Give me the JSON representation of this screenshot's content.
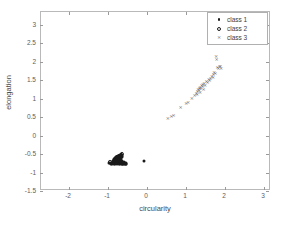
{
  "figure": {
    "background_color": "#ffffff",
    "frame_color": "#b9b9b9"
  },
  "legend": {
    "position": "upper-right",
    "entries": [
      {
        "label": "class 1",
        "marker": "filled-dot-icon",
        "color": "#1a1a1a"
      },
      {
        "label": "class 2",
        "marker": "open-circle-icon",
        "color": "#1a1a1a"
      },
      {
        "label": "class 3",
        "marker": "cross-x-icon",
        "color": "#6b6b6b"
      }
    ]
  },
  "chart_data": {
    "type": "scatter",
    "title": "",
    "xlabel": "circularity",
    "ylabel": "elongation",
    "xlim": [
      -2.72,
      3.18
    ],
    "ylim": [
      -1.5,
      3.35
    ],
    "xticks": [
      -2,
      -1,
      0,
      1,
      2,
      3
    ],
    "xticklabels": [
      "-2",
      "-1",
      "0",
      "1",
      "2",
      "3"
    ],
    "yticks": [
      -1.5,
      -1,
      -0.5,
      0,
      0.5,
      1,
      1.5,
      2,
      2.5,
      3
    ],
    "yticklabels": [
      "-1.5",
      "-1",
      "-0.5",
      "0",
      "0.5",
      "1",
      "1.5",
      "2",
      "2.5",
      "3"
    ],
    "grid": false,
    "series": [
      {
        "name": "class 1",
        "marker": "filled-dot",
        "color": "#1a1a1a",
        "points": [
          [
            -0.97,
            -0.75
          ],
          [
            -0.94,
            -0.74
          ],
          [
            -0.92,
            -0.76
          ],
          [
            -0.9,
            -0.73
          ],
          [
            -0.89,
            -0.77
          ],
          [
            -0.88,
            -0.7
          ],
          [
            -0.86,
            -0.75
          ],
          [
            -0.85,
            -0.72
          ],
          [
            -0.84,
            -0.78
          ],
          [
            -0.83,
            -0.69
          ],
          [
            -0.82,
            -0.74
          ],
          [
            -0.81,
            -0.77
          ],
          [
            -0.8,
            -0.71
          ],
          [
            -0.79,
            -0.75
          ],
          [
            -0.78,
            -0.68
          ],
          [
            -0.77,
            -0.73
          ],
          [
            -0.76,
            -0.78
          ],
          [
            -0.75,
            -0.7
          ],
          [
            -0.74,
            -0.75
          ],
          [
            -0.73,
            -0.72
          ],
          [
            -0.72,
            -0.77
          ],
          [
            -0.71,
            -0.69
          ],
          [
            -0.7,
            -0.74
          ],
          [
            -0.69,
            -0.78
          ],
          [
            -0.68,
            -0.71
          ],
          [
            -0.67,
            -0.75
          ],
          [
            -0.66,
            -0.73
          ],
          [
            -0.65,
            -0.77
          ],
          [
            -0.64,
            -0.7
          ],
          [
            -0.63,
            -0.76
          ],
          [
            -0.62,
            -0.73
          ],
          [
            -0.61,
            -0.78
          ],
          [
            -0.6,
            -0.72
          ],
          [
            -0.59,
            -0.76
          ],
          [
            -0.58,
            -0.74
          ],
          [
            -0.57,
            -0.78
          ],
          [
            -0.56,
            -0.75
          ],
          [
            -0.55,
            -0.77
          ],
          [
            -0.54,
            -0.74
          ],
          [
            -0.53,
            -0.76
          ],
          [
            -0.86,
            -0.66
          ],
          [
            -0.84,
            -0.63
          ],
          [
            -0.82,
            -0.61
          ],
          [
            -0.8,
            -0.64
          ],
          [
            -0.79,
            -0.59
          ],
          [
            -0.78,
            -0.62
          ],
          [
            -0.76,
            -0.58
          ],
          [
            -0.75,
            -0.61
          ],
          [
            -0.74,
            -0.56
          ],
          [
            -0.73,
            -0.6
          ],
          [
            -0.72,
            -0.57
          ],
          [
            -0.71,
            -0.54
          ],
          [
            -0.7,
            -0.58
          ],
          [
            -0.69,
            -0.55
          ],
          [
            -0.68,
            -0.52
          ],
          [
            -0.67,
            -0.57
          ],
          [
            -0.66,
            -0.54
          ],
          [
            -0.65,
            -0.59
          ],
          [
            -0.64,
            -0.56
          ],
          [
            -0.63,
            -0.53
          ],
          [
            -0.88,
            -0.72
          ],
          [
            -0.87,
            -0.68
          ],
          [
            -0.85,
            -0.7
          ],
          [
            -0.83,
            -0.66
          ],
          [
            -0.81,
            -0.68
          ],
          [
            -0.77,
            -0.66
          ],
          [
            -0.7,
            -0.66
          ],
          [
            -0.67,
            -0.64
          ],
          [
            -0.07,
            -0.69
          ]
        ]
      },
      {
        "name": "class 2",
        "marker": "open-circle",
        "color": "#1a1a1a",
        "points": [
          [
            -0.95,
            -0.72
          ],
          [
            -0.78,
            -0.58
          ],
          [
            -0.72,
            -0.55
          ],
          [
            -0.68,
            -0.52
          ],
          [
            -0.64,
            -0.5
          ],
          [
            -0.75,
            -0.6
          ],
          [
            -0.7,
            -0.57
          ],
          [
            -0.66,
            -0.53
          ]
        ]
      },
      {
        "name": "class 3",
        "marker": "cross-x",
        "color": "#6b6b6b",
        "points": [
          [
            0.53,
            0.47
          ],
          [
            0.62,
            0.54
          ],
          [
            0.68,
            0.57
          ],
          [
            0.86,
            0.78
          ],
          [
            1.0,
            0.88
          ],
          [
            1.05,
            0.92
          ],
          [
            1.15,
            1.02
          ],
          [
            1.22,
            1.1
          ],
          [
            1.26,
            1.16
          ],
          [
            1.29,
            1.21
          ],
          [
            1.31,
            1.26
          ],
          [
            1.33,
            1.23
          ],
          [
            1.34,
            1.29
          ],
          [
            1.36,
            1.33
          ],
          [
            1.38,
            1.3
          ],
          [
            1.4,
            1.36
          ],
          [
            1.42,
            1.34
          ],
          [
            1.43,
            1.4
          ],
          [
            1.46,
            1.43
          ],
          [
            1.49,
            1.38
          ],
          [
            1.52,
            1.48
          ],
          [
            1.55,
            1.46
          ],
          [
            1.58,
            1.53
          ],
          [
            1.6,
            1.5
          ],
          [
            1.63,
            1.57
          ],
          [
            1.66,
            1.62
          ],
          [
            1.69,
            1.6
          ],
          [
            1.7,
            1.67
          ],
          [
            1.72,
            1.72
          ],
          [
            1.75,
            1.7
          ],
          [
            1.77,
            2.16
          ],
          [
            1.78,
            2.08
          ],
          [
            1.8,
            1.86
          ],
          [
            1.83,
            1.82
          ],
          [
            1.86,
            1.9
          ],
          [
            1.88,
            1.88
          ],
          [
            1.9,
            1.84
          ],
          [
            1.45,
            1.27
          ],
          [
            1.36,
            1.18
          ],
          [
            1.28,
            1.12
          ]
        ]
      }
    ]
  }
}
